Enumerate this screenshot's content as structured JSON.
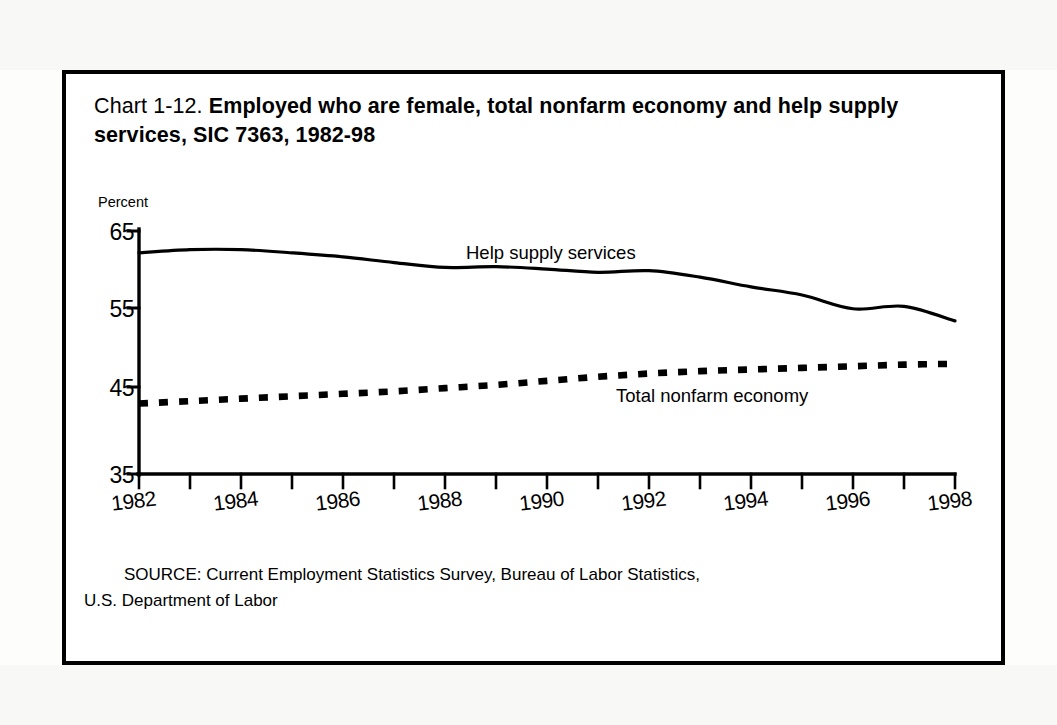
{
  "figure": {
    "label": "Chart 1-12.",
    "title": "Employed who are female, total nonfarm economy and help supply services, SIC 7363, 1982-98",
    "source_line_1": "SOURCE: Current Employment Statistics Survey, Bureau of Labor Statistics,",
    "source_line_2": "U.S. Department of Labor",
    "frame_color": "#000000"
  },
  "chart_data": {
    "type": "line",
    "title": "Chart 1-12. Employed who are female, total nonfarm economy and help supply services, SIC 7363, 1982-98",
    "xlabel": "",
    "ylabel": "Percent",
    "ylim": [
      35,
      65
    ],
    "xlim": [
      1982,
      1998
    ],
    "yticks": [
      35,
      45,
      55,
      65
    ],
    "ytick_labels": [
      "35",
      "45",
      "55",
      "65"
    ],
    "x": [
      1982,
      1983,
      1984,
      1985,
      1986,
      1987,
      1988,
      1989,
      1990,
      1991,
      1992,
      1993,
      1994,
      1995,
      1996,
      1997,
      1998
    ],
    "xticks": [
      1982,
      1984,
      1986,
      1988,
      1990,
      1992,
      1994,
      1996,
      1998
    ],
    "xtick_labels": [
      "1982",
      "1984",
      "1986",
      "1988",
      "1990",
      "1992",
      "1994",
      "1996",
      "1998"
    ],
    "minor_xticks_every": 1,
    "grid": false,
    "legend": "inline-labels",
    "series": [
      {
        "name": "Help supply services",
        "style": "solid",
        "color": "#000000",
        "label_position": "above-line",
        "values": [
          62.3,
          62.7,
          62.7,
          62.3,
          61.8,
          61.1,
          60.5,
          60.6,
          60.3,
          59.9,
          60.1,
          59.3,
          58.1,
          57.1,
          55.4,
          55.7,
          53.9
        ]
      },
      {
        "name": "Total nonfarm economy",
        "style": "dotted",
        "color": "#000000",
        "label_position": "below-line",
        "values": [
          43.7,
          44.0,
          44.3,
          44.6,
          44.9,
          45.2,
          45.6,
          46.0,
          46.5,
          47.0,
          47.4,
          47.7,
          47.9,
          48.1,
          48.3,
          48.5,
          48.6
        ]
      }
    ]
  },
  "axis_caption": "Percent",
  "series_labels": {
    "help": "Help supply services",
    "total": "Total nonfarm economy"
  }
}
